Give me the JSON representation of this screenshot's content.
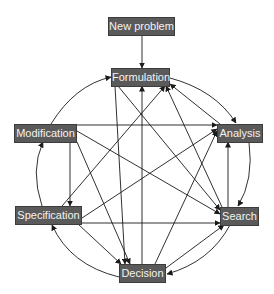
{
  "diagram": {
    "type": "directed-graph",
    "node_color": "#5a5a5a",
    "text_color": "#f2f2f2",
    "edge_color": "#1a1a1a",
    "nodes": {
      "new_problem": "New problem",
      "formulation": "Formulation",
      "modification": "Modification",
      "analysis": "Analysis",
      "specification": "Specification",
      "search": "Search",
      "decision": "Decision"
    },
    "edges": [
      {
        "from": "New problem",
        "to": "Formulation"
      },
      {
        "from": "Modification",
        "to": "Formulation",
        "style": "arc"
      },
      {
        "from": "Formulation",
        "to": "Analysis",
        "style": "arc"
      },
      {
        "from": "Analysis",
        "to": "Formulation"
      },
      {
        "from": "Search",
        "to": "Formulation"
      },
      {
        "from": "Decision",
        "to": "Formulation"
      },
      {
        "from": "Specification",
        "to": "Formulation"
      },
      {
        "from": "Modification",
        "to": "Analysis"
      },
      {
        "from": "Specification",
        "to": "Analysis"
      },
      {
        "from": "Decision",
        "to": "Analysis"
      },
      {
        "from": "Search",
        "to": "Analysis"
      },
      {
        "from": "Analysis",
        "to": "Search",
        "style": "arc"
      },
      {
        "from": "Modification",
        "to": "Search"
      },
      {
        "from": "Specification",
        "to": "Search"
      },
      {
        "from": "Formulation",
        "to": "Search"
      },
      {
        "from": "Decision",
        "to": "Search"
      },
      {
        "from": "Search",
        "to": "Decision",
        "style": "arc"
      },
      {
        "from": "Modification",
        "to": "Decision"
      },
      {
        "from": "Specification",
        "to": "Decision"
      },
      {
        "from": "Formulation",
        "to": "Decision"
      },
      {
        "from": "Decision",
        "to": "Specification",
        "style": "arc"
      },
      {
        "from": "Modification",
        "to": "Specification"
      },
      {
        "from": "Specification",
        "to": "Modification",
        "style": "arc"
      }
    ]
  }
}
